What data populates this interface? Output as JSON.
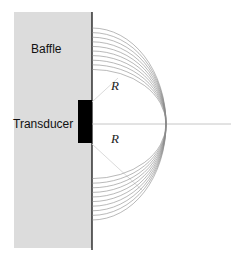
{
  "labels": {
    "baffle": "Baffle",
    "transducer": "Transducer",
    "radius_upper": "R",
    "radius_lower": "R"
  },
  "colors": {
    "baffle_fill": "#dcdcdc",
    "transducer_fill": "#000000",
    "wavefront_stroke": "#8a8a8a",
    "axis_stroke": "#b0b0b0"
  },
  "geometry": {
    "wavefront_count": 10
  }
}
